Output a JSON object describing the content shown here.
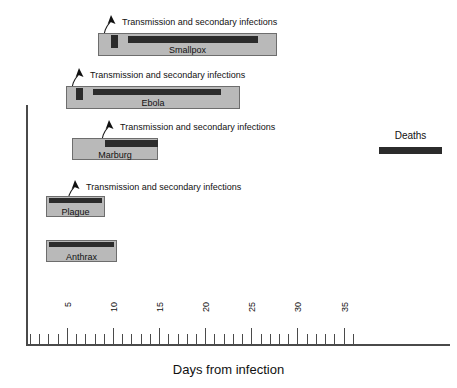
{
  "chart_data": {
    "type": "bar",
    "title": "",
    "xlabel": "Days from infection",
    "ylabel": "",
    "xlim": [
      0,
      38
    ],
    "grid": false,
    "legend_position": "top-right",
    "tick_labels": [
      "5",
      "10",
      "15",
      "20",
      "25",
      "30",
      "35"
    ],
    "tick_values": [
      5,
      10,
      15,
      20,
      25,
      30,
      35
    ],
    "minor_tick_interval": 1,
    "legend": [
      {
        "name": "Deaths",
        "color": "#2b2b2b"
      }
    ],
    "annotation_label": "Transmission and secondary infections",
    "series": [
      {
        "name": "Smallpox",
        "course_start": 7.8,
        "course_end": 27.0,
        "onset_marker_start": 9.2,
        "onset_marker_end": 10.2,
        "deaths_start": 11.0,
        "deaths_end": 25.0,
        "has_annotation": true
      },
      {
        "name": "Ebola",
        "course_start": 4.4,
        "course_end": 23.1,
        "onset_marker_start": 5.6,
        "onset_marker_end": 6.5,
        "deaths_start": 7.4,
        "deaths_end": 21.0,
        "has_annotation": true
      },
      {
        "name": "Marburg",
        "course_start": 5.7,
        "course_end": 14.9,
        "onset_marker_start": null,
        "onset_marker_end": null,
        "deaths_start": 9.2,
        "deaths_end": 14.9,
        "has_annotation": true
      },
      {
        "name": "Plague",
        "course_start": 2.6,
        "course_end": 9.0,
        "onset_marker_start": null,
        "onset_marker_end": null,
        "deaths_start": 2.9,
        "deaths_end": 8.8,
        "has_annotation": true
      },
      {
        "name": "Anthrax",
        "course_start": 2.6,
        "course_end": 10.2,
        "onset_marker_start": null,
        "onset_marker_end": null,
        "deaths_start": 2.9,
        "deaths_end": 10.0,
        "has_annotation": false
      }
    ]
  },
  "axis": {
    "x_title": "Days from infection"
  },
  "legend": {
    "deaths_label": "Deaths"
  },
  "annotations": {
    "smallpox": "Transmission and secondary infections",
    "ebola": "Transmission and secondary infections",
    "marburg": "Transmission and secondary infections",
    "plague": "Transmission and secondary infections"
  },
  "rows": {
    "smallpox_label": "Smallpox",
    "ebola_label": "Ebola",
    "marburg_label": "Marburg",
    "plague_label": "Plague",
    "anthrax_label": "Anthrax"
  },
  "ticks": {
    "t5": "5",
    "t10": "10",
    "t15": "15",
    "t20": "20",
    "t25": "25",
    "t30": "30",
    "t35": "35"
  }
}
